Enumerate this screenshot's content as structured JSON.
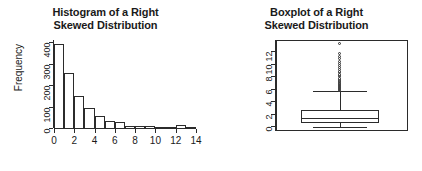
{
  "chart_data": [
    {
      "type": "bar",
      "title": "Histogram of a Right Skewed Distribution",
      "title_line1": "Histogram of a Right",
      "title_line2": "Skewed Distribution",
      "xlabel": "",
      "ylabel": "Frequency",
      "xlim": [
        0,
        14
      ],
      "ylim": [
        0,
        410
      ],
      "grid": false,
      "legend": "none",
      "bin_width": 1,
      "bin_edges": [
        0,
        1,
        2,
        3,
        4,
        5,
        6,
        7,
        8,
        9,
        10,
        11,
        12,
        13,
        14
      ],
      "categories": [
        "0-1",
        "1-2",
        "2-3",
        "3-4",
        "4-5",
        "5-6",
        "6-7",
        "7-8",
        "8-9",
        "9-10",
        "10-11",
        "11-12",
        "12-13",
        "13-14"
      ],
      "values": [
        390,
        255,
        150,
        92,
        55,
        32,
        30,
        10,
        8,
        8,
        5,
        3,
        12,
        4
      ],
      "xticks": [
        0,
        2,
        4,
        6,
        8,
        10,
        12,
        14
      ],
      "xtick_labels": [
        "0",
        "2",
        "4",
        "6",
        "8",
        "10",
        "12",
        "14"
      ],
      "yticks": [
        0,
        100,
        200,
        300,
        400
      ],
      "ytick_labels": [
        "0",
        "100",
        "200",
        "300",
        "400"
      ]
    },
    {
      "type": "boxplot",
      "title": "Boxplot of a Right Skewed Distribution",
      "title_line1": "Boxplot of a Right",
      "title_line2": "Skewed Distribution",
      "xlabel": "",
      "ylabel": "",
      "ylim": [
        -0.6,
        13.6
      ],
      "grid": false,
      "legend": "none",
      "yticks": [
        0,
        2,
        4,
        6,
        8,
        10,
        12
      ],
      "ytick_labels": [
        "0",
        "2",
        "4",
        "6",
        "8",
        "10",
        "12"
      ],
      "box": {
        "lower_whisker": -0.05,
        "q1": 0.5,
        "median": 1.35,
        "q3": 2.6,
        "upper_whisker": 5.6
      },
      "outliers": [
        5.7,
        5.8,
        5.85,
        5.9,
        5.95,
        6.0,
        6.05,
        6.1,
        6.15,
        6.2,
        6.3,
        6.35,
        6.4,
        6.5,
        6.55,
        6.6,
        6.7,
        6.8,
        6.9,
        7.0,
        7.1,
        7.25,
        7.4,
        7.6,
        7.8,
        8.0,
        8.2,
        8.45,
        8.7,
        9.0,
        9.3,
        9.6,
        9.95,
        10.3,
        10.7,
        11.1,
        11.5,
        13.1
      ]
    }
  ]
}
